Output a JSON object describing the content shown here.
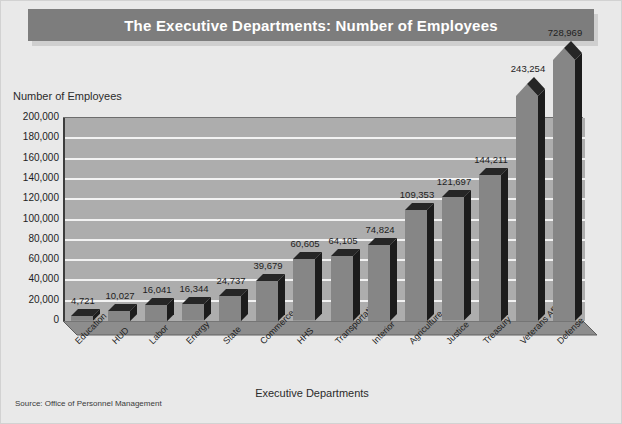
{
  "title": "The Executive Departments: Number of Employees",
  "source_note": "Source: Office of Personnel Management",
  "colors": {
    "page_background": "#e9e9e9",
    "title_bar": "#7d7d7d",
    "title_text": "#ffffff",
    "plot_background": "#adadad",
    "gridline": "#f2f2f2",
    "bar_front": "#868686",
    "bar_side": "#1c1c1c",
    "axis": "#3d3d3d"
  },
  "chart_data": {
    "type": "bar",
    "title": "The Executive Departments: Number of Employees",
    "xlabel": "Executive Departments",
    "ylabel": "Number of Employees",
    "ylim": [
      0,
      200000
    ],
    "ytick_step": 20000,
    "grid": true,
    "legend": "none",
    "note": "The two largest bars exceed the axis maximum and are drawn with arrow tips breaking above the plot area.",
    "ytick_labels": [
      "0",
      "20,000",
      "40,000",
      "60,000",
      "80,000",
      "100,000",
      "120,000",
      "140,000",
      "160,000",
      "180,000",
      "200,000"
    ],
    "categories": [
      "Education",
      "HUD",
      "Labor",
      "Energy",
      "State",
      "Commerce",
      "HHS",
      "Transportation",
      "Interior",
      "Agriculture",
      "Justice",
      "Treasury",
      "Veterans Affairs",
      "Defense"
    ],
    "values": [
      4721,
      10027,
      16041,
      16344,
      24737,
      39679,
      60605,
      64105,
      74824,
      109353,
      121697,
      144211,
      243254,
      728969
    ],
    "value_labels": [
      "4,721",
      "10,027",
      "16,041",
      "16,344",
      "24,737",
      "39,679",
      "60,605",
      "64,105",
      "74,824",
      "109,353",
      "121,697",
      "144,211",
      "243,254",
      "728,969"
    ],
    "overflow_bars": [
      "Veterans Affairs",
      "Defense"
    ]
  }
}
